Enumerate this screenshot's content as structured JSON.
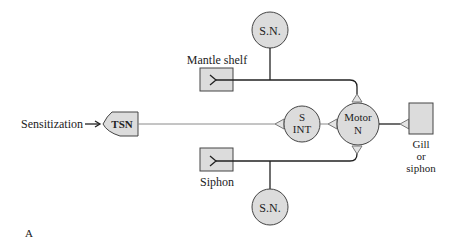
{
  "diagram": {
    "nodes": {
      "sn_top": "S.N.",
      "sn_bottom": "S.N.",
      "mantle_shelf": "Mantle shelf",
      "siphon": "Siphon",
      "tsn": "TSN",
      "s_int_line1": "S",
      "s_int_line2": "INT",
      "motor_line1": "Motor",
      "motor_line2": "N",
      "gill_line1": "Gill",
      "gill_line2": "or",
      "gill_line3": "siphon"
    },
    "input_label": "Sensitization",
    "panel_label": "A",
    "colors": {
      "node_fill": "#dcdcdc",
      "line": "#222222",
      "modulatory_line": "#8a8a8a"
    }
  }
}
